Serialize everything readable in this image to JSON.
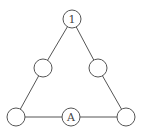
{
  "diagram": {
    "type": "triangle-node-graph",
    "colors": {
      "stroke": "#555555",
      "fill": "#ffffff",
      "text": "#444444"
    },
    "node_radius": 9,
    "nodes": [
      {
        "id": "top",
        "label": "1",
        "cx": 72,
        "cy": 19
      },
      {
        "id": "mid-left",
        "label": "",
        "cx": 43,
        "cy": 68
      },
      {
        "id": "mid-right",
        "label": "",
        "cx": 98,
        "cy": 68
      },
      {
        "id": "bottom-left",
        "label": "",
        "cx": 16,
        "cy": 117
      },
      {
        "id": "bottom-middle",
        "label": "A",
        "cx": 71,
        "cy": 117
      },
      {
        "id": "bottom-right",
        "label": "",
        "cx": 126,
        "cy": 117
      }
    ],
    "edges": [
      [
        "top",
        "mid-left"
      ],
      [
        "mid-left",
        "bottom-left"
      ],
      [
        "top",
        "mid-right"
      ],
      [
        "mid-right",
        "bottom-right"
      ],
      [
        "bottom-left",
        "bottom-middle"
      ],
      [
        "bottom-middle",
        "bottom-right"
      ]
    ]
  }
}
